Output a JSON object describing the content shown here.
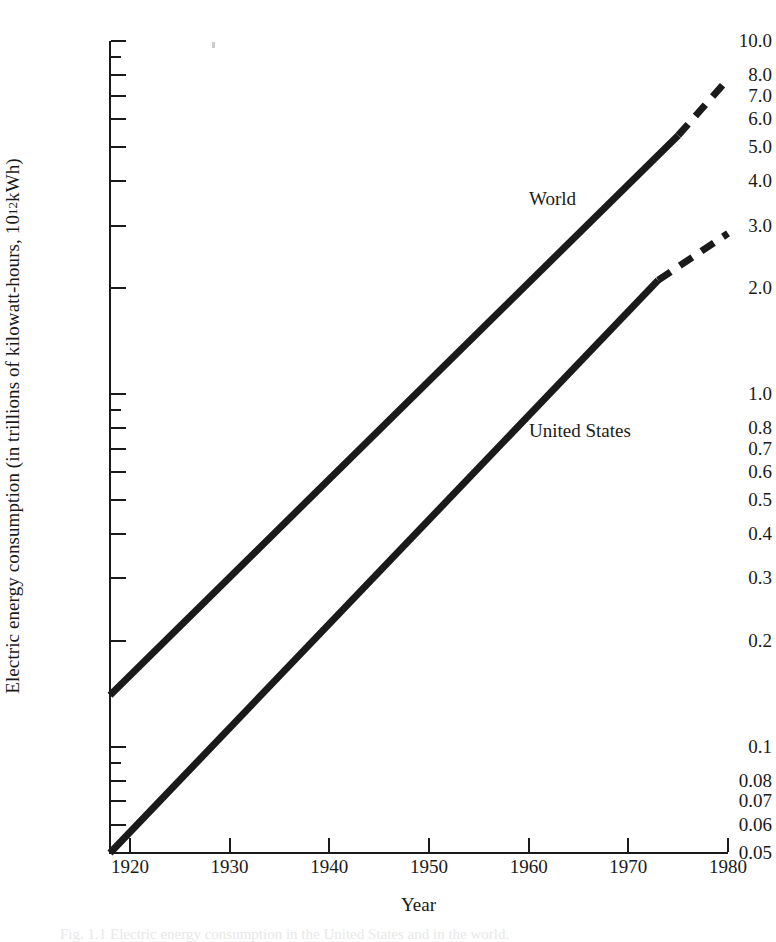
{
  "chart_data": {
    "type": "line",
    "title": "",
    "xlabel": "Year",
    "ylabel": "Electric energy consumption (in trillions of kilowatt-hours, 10",
    "ylabel_sup": "12",
    "ylabel_tail": " kWh)",
    "yscale": "log",
    "xlim": [
      1918,
      1980
    ],
    "ylim": [
      0.05,
      10.0
    ],
    "grid": false,
    "legend_position": "inline-annotation",
    "x_ticks": [
      1920,
      1930,
      1940,
      1950,
      1960,
      1970,
      1980
    ],
    "x_tick_labels": [
      "1920",
      "1930",
      "1940",
      "1950",
      "1960",
      "1970",
      "1980"
    ],
    "y_tick_labels": [
      "10.0",
      "8.0",
      "7.0",
      "6.0",
      "5.0",
      "4.0",
      "3.0",
      "2.0",
      "1.0",
      "0.8",
      "0.7",
      "0.6",
      "0.5",
      "0.4",
      "0.3",
      "0.2",
      "0.1",
      "0.08",
      "0.07",
      "0.06",
      "0.05"
    ],
    "y_major_ticks": [
      10.0,
      8.0,
      7.0,
      6.0,
      5.0,
      4.0,
      3.0,
      2.0,
      1.0,
      0.8,
      0.7,
      0.6,
      0.5,
      0.4,
      0.3,
      0.2,
      0.1,
      0.08,
      0.07,
      0.06,
      0.05
    ],
    "y_minor_ticks": [
      9.0,
      0.9,
      0.09
    ],
    "series": [
      {
        "name": "World",
        "label": "World",
        "style": "solid-with-dashed-projection",
        "solid_points": [
          {
            "x": 1918,
            "y": 0.14
          },
          {
            "x": 1975,
            "y": 5.4
          }
        ],
        "dashed_points": [
          {
            "x": 1975,
            "y": 5.4
          },
          {
            "x": 1980,
            "y": 7.8
          }
        ]
      },
      {
        "name": "United States",
        "label": "United States",
        "style": "solid-with-dashed-projection",
        "solid_points": [
          {
            "x": 1918,
            "y": 0.05
          },
          {
            "x": 1973,
            "y": 2.1
          }
        ],
        "dashed_points": [
          {
            "x": 1973,
            "y": 2.1
          },
          {
            "x": 1980,
            "y": 2.85
          }
        ]
      }
    ]
  },
  "annotations": {
    "world_label": "World",
    "us_label": "United States"
  },
  "axes": {
    "x_title": "Year"
  },
  "caption": {
    "text": "Fig. 1.1   Electric energy consumption in the United States and in the world."
  },
  "colors": {
    "ink": "#1a1a1a",
    "background": "#ffffff"
  }
}
